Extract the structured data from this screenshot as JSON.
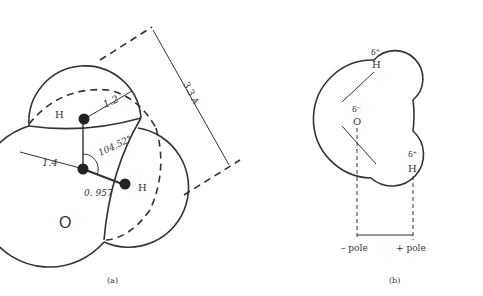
{
  "panel_a": {
    "caption": "(a)",
    "atom_O": "O",
    "atom_H1": "H",
    "atom_H2": "H",
    "dim_vdw_H": "1.2",
    "dim_vdw_O": "1.4",
    "dim_angle": "104.52°",
    "dim_bond": "0. 957",
    "dim_length": "3.3 A"
  },
  "panel_b": {
    "caption": "(b)",
    "atom_O": "O",
    "atom_H1": "H",
    "atom_H2": "H",
    "charge_O": "δ⁻",
    "charge_H1": "δ⁺",
    "charge_H2": "δ⁺",
    "neg_pole": "– pole",
    "pos_pole": "+ pole"
  }
}
